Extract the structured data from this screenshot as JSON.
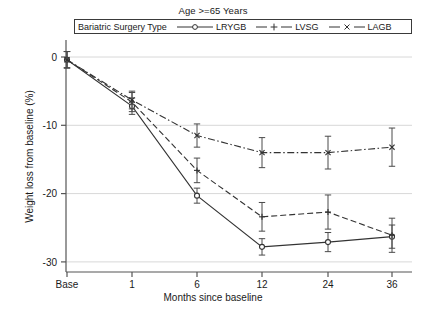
{
  "chart_data": {
    "type": "line",
    "title": "Age >=65 Years",
    "xlabel": "Months since baseline",
    "ylabel": "Weight loss from baseline (%)",
    "legend_title": "Bariatric Surgery Type",
    "legend_position": "top-inside",
    "grid": "horizontal",
    "x": [
      "Base",
      "1",
      "6",
      "12",
      "24",
      "36"
    ],
    "xtick_labels": [
      "Base",
      "1",
      "6",
      "12",
      "24",
      "36"
    ],
    "ytick_labels": [
      "0",
      "-10",
      "-20",
      "-30"
    ],
    "ytick_values": [
      0,
      -10,
      -20,
      -30
    ],
    "ylim": [
      -31.5,
      1.5
    ],
    "series": [
      {
        "name": "LRYGB",
        "marker": "circle",
        "line_style": "solid",
        "color": "#333333",
        "values": [
          -0.4,
          -7.2,
          -20.3,
          -27.8,
          -27.1,
          -26.3
        ],
        "err_low": [
          -1.6,
          -8.4,
          -21.4,
          -29.0,
          -28.5,
          -28.0
        ],
        "err_high": [
          0.8,
          -6.0,
          -19.2,
          -26.6,
          -25.7,
          -24.6
        ]
      },
      {
        "name": "LVSG",
        "marker": "plus",
        "line_style": "dashed",
        "color": "#333333",
        "values": [
          -0.4,
          -6.6,
          -16.6,
          -23.4,
          -22.7,
          -26.1
        ],
        "err_low": [
          -1.6,
          -8.0,
          -18.4,
          -25.5,
          -25.2,
          -28.6
        ],
        "err_high": [
          0.8,
          -5.2,
          -14.8,
          -21.3,
          -20.2,
          -23.6
        ]
      },
      {
        "name": "LAGB",
        "marker": "cross",
        "line_style": "dash-dot",
        "color": "#333333",
        "values": [
          -0.4,
          -6.3,
          -11.5,
          -14.0,
          -14.0,
          -13.2
        ],
        "err_low": [
          -1.6,
          -7.6,
          -13.2,
          -16.2,
          -16.4,
          -16.0
        ],
        "err_high": [
          0.8,
          -5.0,
          -9.8,
          -11.8,
          -11.6,
          -10.4
        ]
      }
    ]
  }
}
